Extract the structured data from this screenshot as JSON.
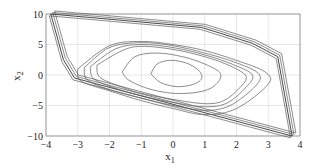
{
  "chart_data": {
    "type": "line",
    "title": "",
    "xlabel": "x",
    "xlabel_sub": "1",
    "ylabel": "x",
    "ylabel_sub": "2",
    "xlim": [
      -4,
      4
    ],
    "ylim": [
      -10,
      10
    ],
    "grid": true,
    "legend": null,
    "x_ticks": [
      -4,
      -3,
      -2,
      -1,
      0,
      1,
      2,
      3,
      4
    ],
    "y_ticks": [
      -10,
      -5,
      0,
      5,
      10
    ],
    "x_tick_labels": [
      "−4",
      "−3",
      "−2",
      "−1",
      "0",
      "1",
      "2",
      "3",
      "4"
    ],
    "y_tick_labels": [
      "−10",
      "−5",
      "0",
      "5",
      "10"
    ],
    "series": [
      {
        "name": "outer-boundary-polygon",
        "x": [
          -3.85,
          0.9,
          2.5,
          3.3,
          3.75,
          -3.1,
          -3.45,
          -3.85
        ],
        "y": [
          10,
          7.8,
          5.2,
          3.0,
          -10,
          -0.5,
          2.5,
          10
        ]
      },
      {
        "name": "trajectories",
        "description": "Family of spiral trajectories converging toward origin, bounded by the outer polygon",
        "spirals": [
          {
            "x": [
              -3.0,
              -2.0,
              -1.0,
              0.0,
              1.0,
              2.0,
              2.9,
              3.0,
              2.0,
              1.0,
              0.0,
              -1.0,
              -2.0,
              -2.9,
              -3.0
            ],
            "y": [
              1.0,
              4.8,
              5.5,
              5.0,
              4.0,
              2.4,
              0.5,
              -1.5,
              -5.5,
              -6.5,
              -5.5,
              -4.2,
              -2.6,
              -1.0,
              1.0
            ]
          },
          {
            "x": [
              -2.8,
              -2.0,
              -1.0,
              0.0,
              1.0,
              2.0,
              2.7,
              2.6,
              1.8,
              1.0,
              0.0,
              -1.0,
              -2.0,
              -2.7,
              -2.8
            ],
            "y": [
              1.2,
              4.5,
              5.3,
              4.8,
              3.6,
              2.0,
              0.2,
              -1.8,
              -5.0,
              -5.8,
              -5.0,
              -3.8,
              -2.4,
              -0.8,
              1.2
            ]
          },
          {
            "x": [
              -2.6,
              -1.8,
              -1.0,
              0.0,
              1.0,
              1.9,
              2.5,
              2.3,
              1.7,
              1.0,
              0.0,
              -1.0,
              -1.8,
              -2.5,
              -2.6
            ],
            "y": [
              1.4,
              4.3,
              5.0,
              4.5,
              3.3,
              1.7,
              0.0,
              -2.0,
              -4.6,
              -5.2,
              -4.5,
              -3.4,
              -2.2,
              -0.6,
              1.4
            ]
          },
          {
            "x": [
              -2.4,
              -1.6,
              -1.0,
              0.0,
              1.0,
              1.8,
              2.3,
              2.1,
              1.6,
              1.0,
              0.0,
              -1.0,
              -1.6,
              -2.3,
              -2.4
            ],
            "y": [
              1.6,
              4.0,
              4.7,
              4.2,
              3.0,
              1.5,
              -0.2,
              -2.1,
              -4.2,
              -4.7,
              -4.0,
              -3.0,
              -2.0,
              -0.4,
              1.6
            ]
          },
          {
            "x": [
              -1.6,
              -1.2,
              -0.5,
              0.3,
              1.0,
              1.5,
              1.3,
              0.8,
              0.0,
              -0.8,
              -1.4,
              -1.6
            ],
            "y": [
              0.5,
              3.0,
              3.6,
              3.0,
              1.8,
              0.2,
              -1.8,
              -2.8,
              -3.0,
              -2.2,
              -0.8,
              0.5
            ]
          },
          {
            "x": [
              -0.7,
              -0.5,
              -0.1,
              0.4,
              0.8,
              0.9,
              0.6,
              0.1,
              -0.4,
              -0.7
            ],
            "y": [
              0.2,
              1.8,
              2.4,
              2.0,
              0.8,
              -0.6,
              -1.6,
              -1.9,
              -1.2,
              0.2
            ]
          }
        ]
      }
    ]
  }
}
